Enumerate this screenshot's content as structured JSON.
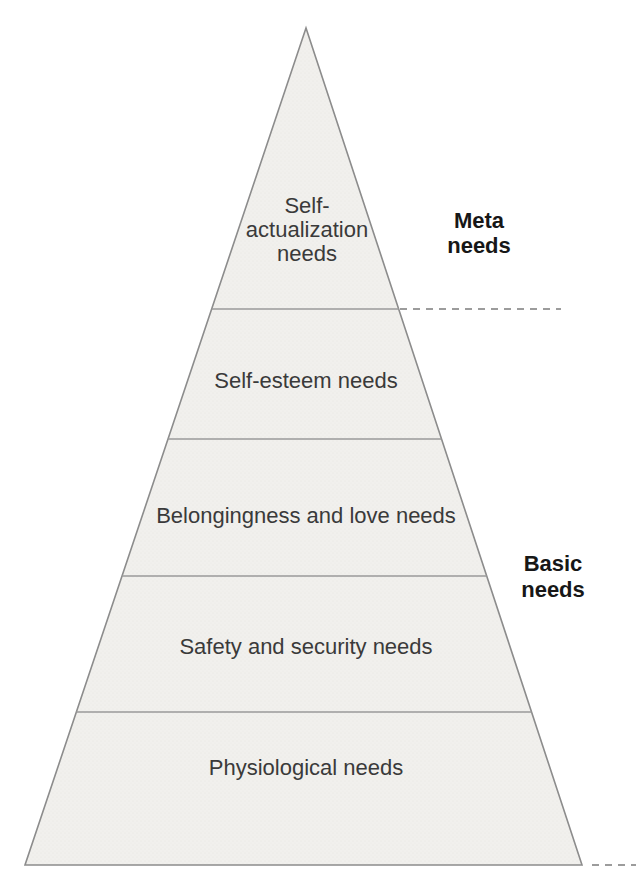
{
  "pyramid": {
    "kind": "maslow-hierarchy-pyramid",
    "levels": [
      {
        "id": "self-actualization",
        "label": "Self-actualization needs",
        "label_lines": [
          "Self-",
          "actualization",
          "needs"
        ]
      },
      {
        "id": "self-esteem",
        "label": "Self-esteem needs"
      },
      {
        "id": "belongingness",
        "label": "Belongingness and love needs"
      },
      {
        "id": "safety",
        "label": "Safety and security needs"
      },
      {
        "id": "physiological",
        "label": "Physiological needs"
      }
    ],
    "annotations": [
      {
        "id": "meta-needs",
        "label": "Meta needs",
        "lines": [
          "Meta",
          "needs"
        ]
      },
      {
        "id": "basic-needs",
        "label": "Basic needs",
        "lines": [
          "Basic",
          "needs"
        ]
      }
    ],
    "colors": {
      "pyramid_fill": "#f1f0ed",
      "pyramid_outline": "#8c8c8c",
      "divider_line": "#9a9a9a",
      "dashed_line": "#9c9c9c",
      "level_text": "#3a3a3a",
      "annotation_text": "#171717",
      "background": "#ffffff"
    }
  }
}
